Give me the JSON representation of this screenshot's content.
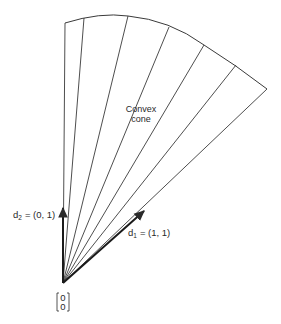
{
  "figure": {
    "type": "diagram",
    "colors": {
      "background": "#ffffff",
      "ink": "#2a2a2a"
    }
  },
  "cone": {
    "label_line1": "Convex",
    "label_line2": "cone",
    "origin": [
      63,
      283
    ],
    "ray_endpoints": [
      [
        65,
        23
      ],
      [
        84,
        18
      ],
      [
        128,
        16
      ],
      [
        169,
        27
      ],
      [
        204,
        45
      ],
      [
        236,
        65
      ],
      [
        267,
        89
      ]
    ]
  },
  "vectors": {
    "d2": {
      "name": "d",
      "subscript": "2",
      "value": "= (0, 1)",
      "tip": [
        63,
        206
      ]
    },
    "d1": {
      "name": "d",
      "subscript": "1",
      "value": "= (1, 1)",
      "tip": [
        144,
        211
      ]
    }
  },
  "origin_label": {
    "top": "0",
    "bottom": "0"
  }
}
